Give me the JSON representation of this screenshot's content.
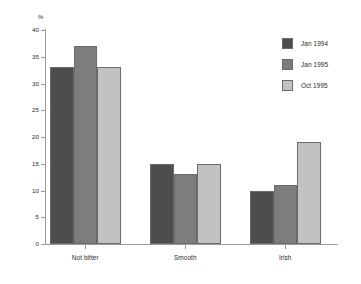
{
  "chart_data": {
    "type": "bar",
    "title": "",
    "subtitle": "",
    "xlabel": "",
    "ylabel": "%",
    "ylim": [
      0,
      40
    ],
    "ytick_step": 5,
    "yticks": [
      "40",
      "35",
      "30",
      "25",
      "20",
      "15",
      "10",
      "5",
      "0"
    ],
    "grid": false,
    "legend_position": "right",
    "categories": [
      "Not bitter",
      "Smooth",
      "Irish"
    ],
    "series": [
      {
        "name": "Jan 1994",
        "color": "#4d4d4d",
        "values": [
          33,
          15,
          10
        ]
      },
      {
        "name": "Jan 1995",
        "color": "#7d7d7d",
        "values": [
          37,
          13,
          11
        ]
      },
      {
        "name": "Oct 1995",
        "color": "#c2c2c2",
        "values": [
          33,
          15,
          19
        ]
      }
    ],
    "axis_color": "#9a9a9a",
    "bar_border_color": "#6b6b6b",
    "background": "#ffffff",
    "text_color": "#2a2a2a"
  }
}
